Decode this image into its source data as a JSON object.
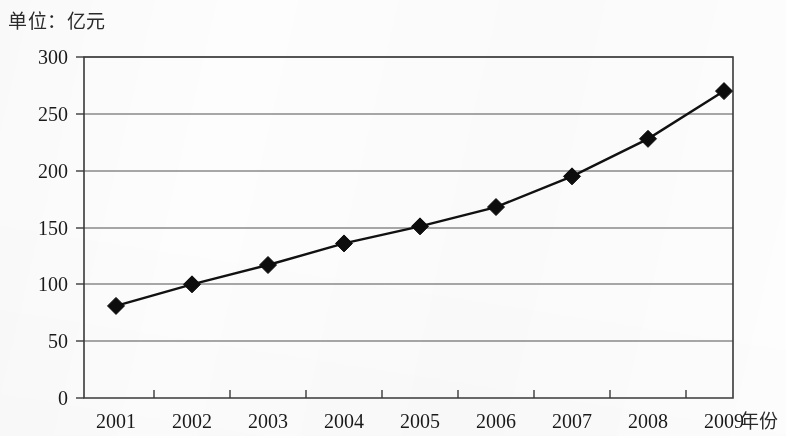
{
  "unit_title": "单位：亿元",
  "x_axis_name": "年份",
  "chart_data": {
    "type": "line",
    "title": "单位：亿元",
    "subtitle": "",
    "xlabel": "年份",
    "ylabel": "",
    "categories": [
      "2001",
      "2002",
      "2003",
      "2004",
      "2005",
      "2006",
      "2007",
      "2008",
      "2009"
    ],
    "values": [
      81,
      100,
      117,
      136,
      151,
      168,
      195,
      228,
      270
    ],
    "series": [
      {
        "name": "",
        "values": [
          81,
          100,
          117,
          136,
          151,
          168,
          195,
          228,
          270
        ]
      }
    ],
    "ylim": [
      0,
      300
    ],
    "y_ticks": [
      0,
      50,
      100,
      150,
      200,
      250,
      300
    ],
    "y_tick_labels": [
      "0",
      "50",
      "100",
      "150",
      "200",
      "250",
      "300"
    ],
    "x_tick_labels": [
      "2001",
      "2002",
      "2003",
      "2004",
      "2005",
      "2006",
      "2007",
      "2008",
      "2009"
    ],
    "grid": true,
    "grid_orientation": "horizontal",
    "legend": false,
    "legend_position": "none",
    "marker": "diamond",
    "line_color": "#111111",
    "marker_color": "#0d0d0d",
    "grid_color": "#8a8a8a",
    "frame_color": "#3a3a3a",
    "background_color": "#fdfdfd",
    "annotations": []
  }
}
